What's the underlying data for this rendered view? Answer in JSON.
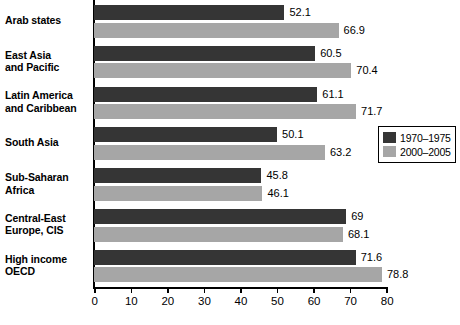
{
  "chart_data": {
    "type": "bar",
    "orientation": "horizontal",
    "title": "",
    "subtitle": "",
    "xlabel": "",
    "ylabel": "",
    "xlim": [
      0,
      80
    ],
    "xticks": [
      0,
      10,
      20,
      30,
      40,
      50,
      60,
      70,
      80
    ],
    "xtick_labels": [
      "0",
      "10",
      "20",
      "30",
      "40",
      "50",
      "60",
      "70",
      "80"
    ],
    "grid": false,
    "legend_position": "middle-right",
    "categories": [
      "Arab states",
      "East Asia and Pacific",
      "Latin America and Caribbean",
      "South Asia",
      "Sub-Saharan Africa",
      "Central-East Europe, CIS",
      "High income OECD"
    ],
    "category_lines": [
      [
        "Arab states",
        ""
      ],
      [
        "East Asia",
        "and Pacific"
      ],
      [
        "Latin America",
        "and Caribbean"
      ],
      [
        "South Asia",
        ""
      ],
      [
        "Sub-Saharan",
        "Africa"
      ],
      [
        "Central-East",
        "Europe, CIS"
      ],
      [
        "High income",
        "OECD"
      ]
    ],
    "series": [
      {
        "name": "1970–1975",
        "color": "#353535",
        "values": [
          52.1,
          60.5,
          61.1,
          50.1,
          45.8,
          69,
          71.6
        ],
        "labels": [
          "52.1",
          "60.5",
          "61.1",
          "50.1",
          "45.8",
          "69",
          "71.6"
        ]
      },
      {
        "name": "2000–2005",
        "color": "#a6a6a6",
        "values": [
          66.9,
          70.4,
          71.7,
          63.2,
          46.1,
          68.1,
          78.8
        ],
        "labels": [
          "66.9",
          "70.4",
          "71.7",
          "63.2",
          "46.1",
          "68.1",
          "78.8"
        ]
      }
    ]
  },
  "legend": {
    "items": [
      {
        "label": "1970–1975",
        "color": "#353535"
      },
      {
        "label": "2000–2005",
        "color": "#a6a6a6"
      }
    ]
  }
}
